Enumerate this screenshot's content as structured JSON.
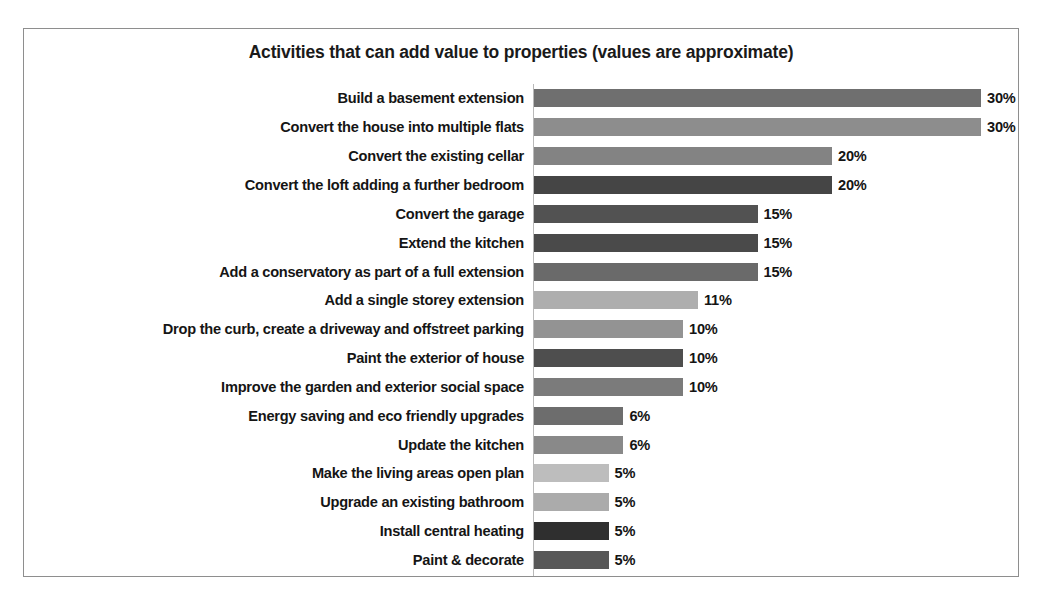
{
  "chart_data": {
    "type": "bar",
    "orientation": "horizontal",
    "title": "Activities that can add value to properties (values are approximate)",
    "xlabel": "",
    "ylabel": "",
    "xlim": [
      0,
      30
    ],
    "grid": false,
    "legend": null,
    "value_suffix": "%",
    "categories": [
      "Build a basement extension",
      "Convert the house into multiple flats",
      "Convert the existing cellar",
      "Convert the loft adding a further bedroom",
      "Convert the garage",
      "Extend the kitchen",
      "Add a conservatory as part of a full extension",
      "Add a single storey extension",
      "Drop the curb, create a driveway and offstreet parking",
      "Paint the exterior of house",
      "Improve the garden and exterior social space",
      "Energy saving and eco friendly upgrades",
      "Update the kitchen",
      "Make the living areas open plan",
      "Upgrade an existing bathroom",
      "Install central heating",
      "Paint & decorate"
    ],
    "values": [
      30,
      30,
      20,
      20,
      15,
      15,
      15,
      11,
      10,
      10,
      10,
      6,
      6,
      5,
      5,
      5,
      5
    ],
    "value_labels": [
      "30%",
      "30%",
      "20%",
      "20%",
      "15%",
      "15%",
      "15%",
      "11%",
      "10%",
      "10%",
      "10%",
      "6%",
      "6%",
      "5%",
      "5%",
      "5%",
      "5%"
    ],
    "bar_colors": [
      "#6f6f6f",
      "#8d8d8d",
      "#838383",
      "#454545",
      "#525252",
      "#4a4a4a",
      "#6a6a6a",
      "#aeaeae",
      "#939393",
      "#4e4e4e",
      "#7b7b7b",
      "#6d6d6d",
      "#898989",
      "#bdbdbd",
      "#ababab",
      "#2f2f2f",
      "#585858"
    ]
  },
  "frame": {
    "border_color": "#8e8e8e",
    "background": "#ffffff",
    "axis_color": "#b9b9b9"
  }
}
